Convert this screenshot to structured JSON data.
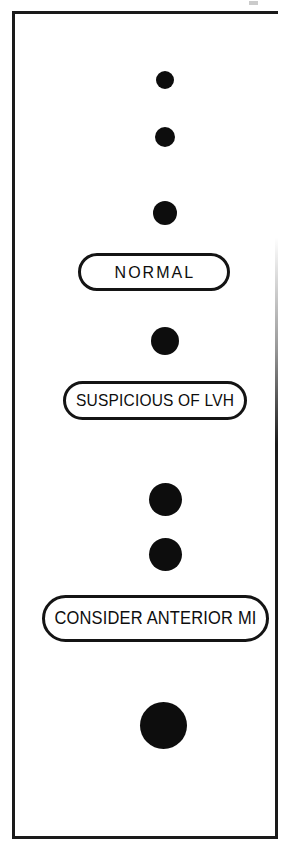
{
  "diagram": {
    "background_color": "#ffffff",
    "ink_color": "#0d0d0d",
    "frame": {
      "stroke_color": "#1a1a1a",
      "stroke_width_px": 3
    },
    "nodes": [
      {
        "id": "dot-1",
        "type": "dot",
        "diameter_px": 18,
        "center_x": 152,
        "center_y": 68,
        "fill": "#0d0d0d"
      },
      {
        "id": "dot-2",
        "type": "dot",
        "diameter_px": 20,
        "center_x": 152,
        "center_y": 125,
        "fill": "#0d0d0d"
      },
      {
        "id": "dot-3",
        "type": "dot",
        "diameter_px": 24,
        "center_x": 152,
        "center_y": 201,
        "fill": "#0d0d0d"
      },
      {
        "id": "pill-normal",
        "type": "pill",
        "label": "NORMAL",
        "center_x": 139,
        "center_y": 258
      },
      {
        "id": "dot-4",
        "type": "dot",
        "diameter_px": 28,
        "center_x": 152,
        "center_y": 328,
        "fill": "#0d0d0d"
      },
      {
        "id": "pill-lvh",
        "type": "pill",
        "label": "SUSPICIOUS OF LVH",
        "center_x": 140,
        "center_y": 386
      },
      {
        "id": "dot-5",
        "type": "dot",
        "diameter_px": 33,
        "center_x": 152,
        "center_y": 486,
        "fill": "#0d0d0d"
      },
      {
        "id": "dot-6",
        "type": "dot",
        "diameter_px": 33,
        "center_x": 152,
        "center_y": 541,
        "fill": "#0d0d0d"
      },
      {
        "id": "pill-ami",
        "type": "pill",
        "label": "CONSIDER ANTERIOR MI",
        "center_x": 140,
        "center_y": 604
      },
      {
        "id": "dot-7",
        "type": "dot",
        "diameter_px": 47,
        "center_x": 148,
        "center_y": 712,
        "fill": "#0d0d0d"
      }
    ],
    "labels": {
      "normal": "NORMAL",
      "lvh": "SUSPICIOUS OF LVH",
      "anterior_mi": "CONSIDER ANTERIOR MI"
    }
  }
}
